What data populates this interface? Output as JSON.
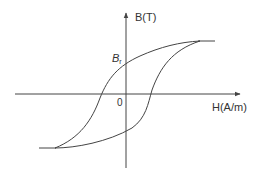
{
  "diagram": {
    "y_axis_label": "B(T)",
    "x_axis_label": "H(A/m)",
    "origin_label": "0",
    "remanence_label": {
      "main": "B",
      "sub": "r"
    },
    "colors": {
      "stroke": "#444444",
      "text": "#333333"
    }
  }
}
